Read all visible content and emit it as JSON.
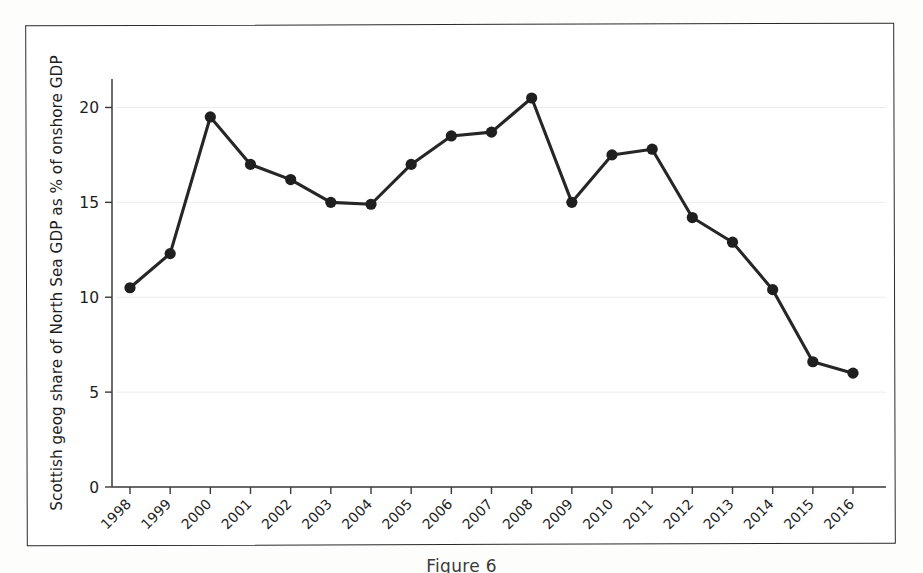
{
  "figure": {
    "caption": "Figure 6",
    "frame_color": "#2a2a2a",
    "background": "#ffffff"
  },
  "chart_data": {
    "type": "line",
    "title": "",
    "xlabel": "",
    "ylabel": "Scottish geog share of North Sea GDP as % of onshore GDP",
    "categories": [
      "1998",
      "1999",
      "2000",
      "2001",
      "2002",
      "2003",
      "2004",
      "2005",
      "2006",
      "2007",
      "2008",
      "2009",
      "2010",
      "2011",
      "2012",
      "2013",
      "2014",
      "2015",
      "2016"
    ],
    "values": [
      10.5,
      12.3,
      19.5,
      17.0,
      16.2,
      15.0,
      14.9,
      17.0,
      18.5,
      18.7,
      20.5,
      15.0,
      17.5,
      17.8,
      14.2,
      12.9,
      10.4,
      6.6,
      6.0
    ],
    "ylim": [
      0,
      21.5
    ],
    "yticks": [
      0,
      5,
      10,
      15,
      20
    ],
    "ytick_labels": [
      "0",
      "5",
      "10",
      "15",
      "20"
    ],
    "grid": true,
    "grid_color": "#ececec",
    "legend": null,
    "line_color": "#262626",
    "marker": "circle",
    "marker_color": "#1f1f1f",
    "xtick_rotation": -45
  }
}
